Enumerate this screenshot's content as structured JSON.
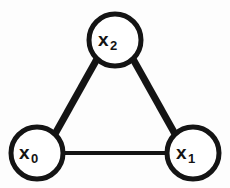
{
  "figure": {
    "kind": "undirected-graph-diagram",
    "background_color": "#fdfdfd",
    "stroke_color": "#141414",
    "node_fill_color": "#ffffff",
    "width": 230,
    "height": 188
  },
  "nodes": [
    {
      "id": "x0",
      "name": "node-x0",
      "label_base": "x",
      "label_subscript": "0",
      "cx": 37,
      "cy": 153,
      "r": 26,
      "stroke_width": 5,
      "label_x": 19,
      "label_y": 143
    },
    {
      "id": "x1",
      "name": "node-x1",
      "label_base": "x",
      "label_subscript": "1",
      "cx": 193,
      "cy": 153,
      "r": 26,
      "stroke_width": 5,
      "label_x": 176,
      "label_y": 143
    },
    {
      "id": "x2",
      "name": "node-x2",
      "label_base": "x",
      "label_subscript": "2",
      "cx": 115,
      "cy": 40,
      "r": 26,
      "stroke_width": 5,
      "label_x": 98,
      "label_y": 30
    }
  ],
  "edges": [
    {
      "id": "e-x0-x2",
      "name": "edge-x0-x2",
      "source": "x0",
      "target": "x2",
      "x1": 55,
      "y1": 134,
      "x2": 97,
      "y2": 59,
      "stroke_width": 7
    },
    {
      "id": "e-x2-x1",
      "name": "edge-x2-x1",
      "source": "x2",
      "target": "x1",
      "x1": 133,
      "y1": 59,
      "x2": 175,
      "y2": 134,
      "stroke_width": 7
    },
    {
      "id": "e-x0-x1",
      "name": "edge-x0-x1",
      "source": "x0",
      "target": "x1",
      "x1": 63,
      "y1": 153,
      "x2": 167,
      "y2": 153,
      "stroke_width": 4
    }
  ]
}
